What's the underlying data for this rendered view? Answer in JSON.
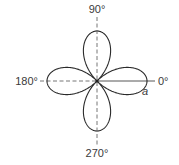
{
  "diagram": {
    "type": "polar-rose",
    "petals": 4,
    "axis_labels": {
      "top": "90°",
      "left": "180°",
      "right": "0°",
      "bottom": "270°"
    },
    "petal_tip_label": "a",
    "colors": {
      "curve": "#2b2b2b",
      "axis": "#555555",
      "text": "#3a3a3a"
    }
  }
}
